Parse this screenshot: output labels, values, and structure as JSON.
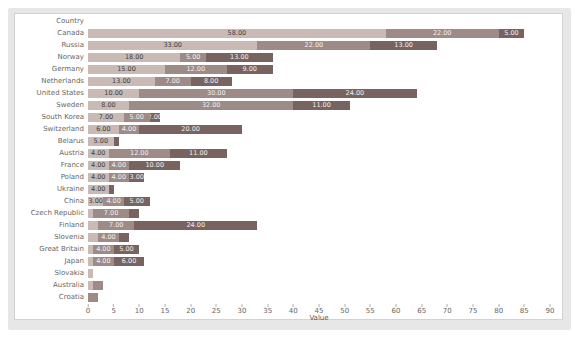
{
  "colors": {
    "page_mat": "#e7e7e7",
    "panel_bg": "#ffffff",
    "panel_border": "#d2d2d2",
    "tick_text": "#666666",
    "category_text": "#666666"
  },
  "chart_data": {
    "type": "bar",
    "stacked": true,
    "orientation": "horizontal",
    "y_axis_title": "Country",
    "xlabel": "Value",
    "xlim": [
      0,
      90
    ],
    "xticks": [
      0,
      5,
      10,
      15,
      20,
      25,
      30,
      35,
      40,
      45,
      50,
      55,
      60,
      65,
      70,
      75,
      80,
      85,
      90
    ],
    "grid": false,
    "legend": "none",
    "categories": [
      "Canada",
      "Russia",
      "Norway",
      "Germany",
      "Netherlands",
      "United States",
      "Sweden",
      "South Korea",
      "Switzerland",
      "Belarus",
      "Austria",
      "France",
      "Poland",
      "Ukraine",
      "China",
      "Czech Republic",
      "Finland",
      "Slovenia",
      "Great Britain",
      "Japan",
      "Slovakia",
      "Australia",
      "Croatia"
    ],
    "series": [
      {
        "name": "segment-1",
        "color": "#c9bab6",
        "values": [
          58,
          33,
          18,
          15,
          13,
          10,
          8,
          7,
          6,
          5,
          4,
          4,
          4,
          4,
          3,
          1,
          2,
          2,
          1,
          1,
          1,
          1,
          0
        ]
      },
      {
        "name": "segment-2",
        "color": "#9e8b87",
        "values": [
          22,
          22,
          5,
          12,
          7,
          30,
          32,
          5,
          4,
          0,
          12,
          4,
          4,
          0,
          4,
          7,
          7,
          4,
          4,
          4,
          0,
          2,
          2
        ]
      },
      {
        "name": "segment-3",
        "color": "#786360",
        "values": [
          5,
          13,
          13,
          9,
          8,
          24,
          11,
          2,
          20,
          1,
          11,
          10,
          3,
          1,
          5,
          2,
          24,
          2,
          5,
          6,
          0,
          0,
          0
        ]
      }
    ],
    "value_labels": [
      [
        "58.00",
        "22.00",
        "5.00"
      ],
      [
        "33.00",
        "22.00",
        "13.00"
      ],
      [
        "18.00",
        "5.00",
        "13.00"
      ],
      [
        "15.00",
        "12.00",
        "9.00"
      ],
      [
        "13.00",
        "7.00",
        "8.00"
      ],
      [
        "10.00",
        "30.00",
        "24.00"
      ],
      [
        "8.00",
        "32.00",
        "11.00"
      ],
      [
        "7.00",
        "5.00",
        "2.00"
      ],
      [
        "6.00",
        "4.00",
        "20.00"
      ],
      [
        "5.00",
        "",
        ""
      ],
      [
        "4.00",
        "12.00",
        "11.00"
      ],
      [
        "4.00",
        "4.00",
        "10.00"
      ],
      [
        "4.00",
        "4.00",
        "3.00"
      ],
      [
        "4.00",
        "",
        ""
      ],
      [
        "3.00",
        "4.00",
        "5.00"
      ],
      [
        "",
        "7.00",
        ""
      ],
      [
        "",
        "7.00",
        "24.00"
      ],
      [
        "",
        "4.00",
        ""
      ],
      [
        "",
        "4.00",
        "5.00"
      ],
      [
        "",
        "4.00",
        "6.00"
      ],
      [
        "",
        "",
        ""
      ],
      [
        "",
        "",
        ""
      ],
      [
        "",
        "",
        ""
      ]
    ]
  }
}
